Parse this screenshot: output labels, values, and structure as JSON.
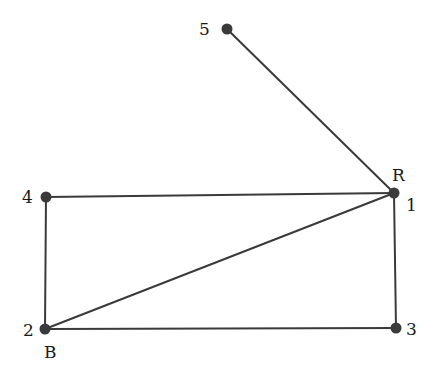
{
  "graph": {
    "nodes": [
      {
        "id": "1",
        "label": "1",
        "tag": "R",
        "x": 394,
        "y": 193
      },
      {
        "id": "2",
        "label": "2",
        "tag": "B",
        "x": 45,
        "y": 329
      },
      {
        "id": "3",
        "label": "3",
        "tag": "",
        "x": 396,
        "y": 328
      },
      {
        "id": "4",
        "label": "4",
        "tag": "",
        "x": 46,
        "y": 197
      },
      {
        "id": "5",
        "label": "5",
        "tag": "",
        "x": 227,
        "y": 29
      }
    ],
    "edges": [
      {
        "from": "5",
        "to": "1"
      },
      {
        "from": "4",
        "to": "1"
      },
      {
        "from": "2",
        "to": "1"
      },
      {
        "from": "1",
        "to": "3"
      },
      {
        "from": "4",
        "to": "2"
      },
      {
        "from": "2",
        "to": "3"
      }
    ]
  },
  "labels": {
    "n1": "1",
    "n1_tag": "R",
    "n2": "2",
    "n2_tag": "B",
    "n3": "3",
    "n4": "4",
    "n5": "5"
  }
}
